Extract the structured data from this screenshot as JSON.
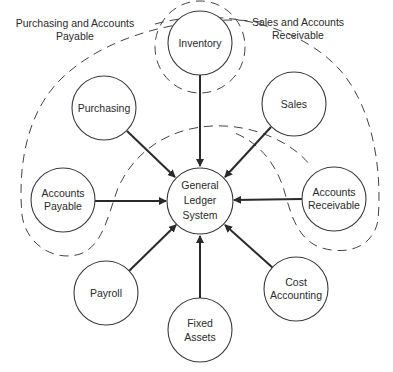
{
  "diagram": {
    "type": "hub-and-spoke",
    "groups": [
      {
        "id": "purchasing_ap",
        "label_lines": [
          "Purchasing and Accounts",
          "Payable"
        ],
        "members": [
          "Purchasing",
          "Accounts Payable",
          "Inventory"
        ]
      },
      {
        "id": "sales_ar",
        "label_lines": [
          "Sales and Accounts",
          "Receivable"
        ],
        "members": [
          "Sales",
          "Accounts Receivable",
          "Inventory"
        ]
      }
    ],
    "hub": {
      "label_lines": [
        "General",
        "Ledger",
        "System"
      ]
    },
    "nodes": [
      {
        "id": "inventory",
        "label_lines": [
          "Inventory"
        ]
      },
      {
        "id": "purchasing",
        "label_lines": [
          "Purchasing"
        ]
      },
      {
        "id": "sales",
        "label_lines": [
          "Sales"
        ]
      },
      {
        "id": "accounts_payable",
        "label_lines": [
          "Accounts",
          "Payable"
        ]
      },
      {
        "id": "accounts_receivable",
        "label_lines": [
          "Accounts",
          "Receivable"
        ]
      },
      {
        "id": "payroll",
        "label_lines": [
          "Payroll"
        ]
      },
      {
        "id": "cost_accounting",
        "label_lines": [
          "Cost",
          "Accounting"
        ]
      },
      {
        "id": "fixed_assets",
        "label_lines": [
          "Fixed",
          "Assets"
        ]
      }
    ],
    "edges": [
      {
        "from": "Inventory",
        "to": "General Ledger System"
      },
      {
        "from": "Purchasing",
        "to": "General Ledger System"
      },
      {
        "from": "Sales",
        "to": "General Ledger System"
      },
      {
        "from": "Accounts Payable",
        "to": "General Ledger System"
      },
      {
        "from": "Accounts Receivable",
        "to": "General Ledger System"
      },
      {
        "from": "Payroll",
        "to": "General Ledger System"
      },
      {
        "from": "Cost Accounting",
        "to": "General Ledger System"
      },
      {
        "from": "Fixed Assets",
        "to": "General Ledger System"
      }
    ]
  }
}
